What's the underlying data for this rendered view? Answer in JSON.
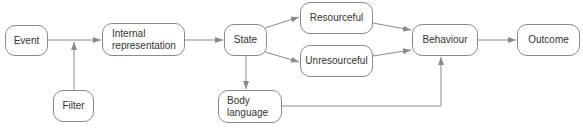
{
  "diagram": {
    "stroke_color": "#8a8a8a",
    "nodes": {
      "event": "Event",
      "internal_representation": "Internal\nrepresentation",
      "filter": "Filter",
      "state": "State",
      "resourceful": "Resourceful",
      "unresourceful": "Unresourceful",
      "body_language": "Body\nlanguage",
      "behaviour": "Behaviour",
      "outcome": "Outcome"
    },
    "edges": [
      {
        "from": "Event",
        "to": "Internal representation"
      },
      {
        "from": "Filter",
        "to": "Event→Internal representation"
      },
      {
        "from": "Internal representation",
        "to": "State"
      },
      {
        "from": "State",
        "to": "Resourceful"
      },
      {
        "from": "State",
        "to": "Unresourceful"
      },
      {
        "from": "State",
        "to": "Body language"
      },
      {
        "from": "Resourceful",
        "to": "Behaviour"
      },
      {
        "from": "Unresourceful",
        "to": "Behaviour"
      },
      {
        "from": "Body language",
        "to": "Behaviour"
      },
      {
        "from": "Behaviour",
        "to": "Outcome"
      }
    ]
  }
}
